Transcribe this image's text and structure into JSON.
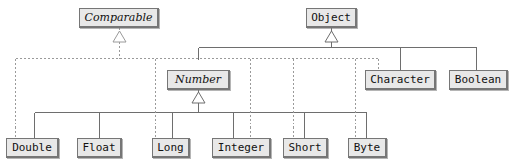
{
  "diagram": {
    "type": "uml-class-hierarchy",
    "background_color": "#ffffff",
    "node_fill_color": "#e8e8e8",
    "node_border_color": "#767676",
    "solid_edge_color": "#6e6e6e",
    "dashed_edge_color": "#9a9a9a",
    "text_color": "#111111"
  },
  "nodes": [
    {
      "id": "comparable",
      "label": "Comparable",
      "kind": "interface",
      "italic": true,
      "x": 79,
      "y": 8,
      "w": 80,
      "h": 20
    },
    {
      "id": "object",
      "label": "Object",
      "kind": "class",
      "italic": false,
      "x": 306,
      "y": 8,
      "w": 51,
      "h": 20
    },
    {
      "id": "number",
      "label": "Number",
      "kind": "abstract-class",
      "italic": true,
      "x": 167,
      "y": 70,
      "w": 63,
      "h": 20
    },
    {
      "id": "character",
      "label": "Character",
      "kind": "class",
      "italic": false,
      "x": 365,
      "y": 70,
      "w": 71,
      "h": 20
    },
    {
      "id": "boolean",
      "label": "Boolean",
      "kind": "class",
      "italic": false,
      "x": 449,
      "y": 70,
      "w": 59,
      "h": 20
    },
    {
      "id": "double",
      "label": "Double",
      "kind": "class",
      "italic": false,
      "x": 6,
      "y": 138,
      "w": 53,
      "h": 20
    },
    {
      "id": "float",
      "label": "Float",
      "kind": "class",
      "italic": false,
      "x": 77,
      "y": 138,
      "w": 45,
      "h": 20
    },
    {
      "id": "long",
      "label": "Long",
      "kind": "class",
      "italic": false,
      "x": 152,
      "y": 138,
      "w": 38,
      "h": 20
    },
    {
      "id": "integer",
      "label": "Integer",
      "kind": "class",
      "italic": false,
      "x": 212,
      "y": 138,
      "w": 59,
      "h": 20
    },
    {
      "id": "short",
      "label": "Short",
      "kind": "class",
      "italic": false,
      "x": 283,
      "y": 138,
      "w": 45,
      "h": 20
    },
    {
      "id": "byte",
      "label": "Byte",
      "kind": "class",
      "italic": false,
      "x": 348,
      "y": 138,
      "w": 39,
      "h": 20
    }
  ],
  "edges": [
    {
      "from": "number",
      "to": "object",
      "style": "solid",
      "relation": "extends"
    },
    {
      "from": "character",
      "to": "object",
      "style": "solid",
      "relation": "extends"
    },
    {
      "from": "boolean",
      "to": "object",
      "style": "solid",
      "relation": "extends"
    },
    {
      "from": "double",
      "to": "number",
      "style": "solid",
      "relation": "extends"
    },
    {
      "from": "float",
      "to": "number",
      "style": "solid",
      "relation": "extends"
    },
    {
      "from": "long",
      "to": "number",
      "style": "solid",
      "relation": "extends"
    },
    {
      "from": "integer",
      "to": "number",
      "style": "solid",
      "relation": "extends"
    },
    {
      "from": "short",
      "to": "number",
      "style": "solid",
      "relation": "extends"
    },
    {
      "from": "byte",
      "to": "number",
      "style": "solid",
      "relation": "extends"
    },
    {
      "from": "double",
      "to": "comparable",
      "style": "dashed",
      "relation": "implements"
    },
    {
      "from": "long",
      "to": "comparable",
      "style": "dashed",
      "relation": "implements"
    },
    {
      "from": "integer",
      "to": "comparable",
      "style": "dashed",
      "relation": "implements"
    },
    {
      "from": "short",
      "to": "comparable",
      "style": "dashed",
      "relation": "implements"
    },
    {
      "from": "byte",
      "to": "comparable",
      "style": "dashed",
      "relation": "implements"
    },
    {
      "from": "character",
      "to": "comparable",
      "style": "dashed",
      "relation": "implements"
    }
  ]
}
